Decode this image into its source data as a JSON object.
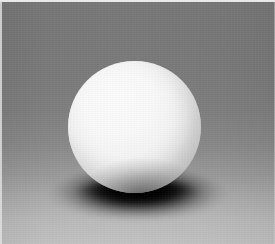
{
  "image": {
    "title": "White sphere on graduated gray background",
    "subject": "matte white sphere",
    "kind": "photograph",
    "width_px": 275,
    "height_px": 244
  },
  "background": {
    "name": "graduated gray studio backdrop",
    "top_color": "#787878",
    "middle_color": "#8a8a8a",
    "bottom_color": "#c2c2c2",
    "gradient_direction": "vertical, dark at top to light at bottom"
  },
  "sphere": {
    "name": "white sphere",
    "fill_color": "#ffffff",
    "terminator_color": "#bdbdbd",
    "highlight_color": "#ffffff",
    "highlight_position": "upper-left",
    "center_x_px": 134,
    "center_y_px": 127,
    "diameter_px": 133
  },
  "shadow": {
    "name": "cast contact shadow",
    "color": "#000000",
    "shape": "ellipse",
    "center_x_px": 138,
    "center_y_px": 196,
    "width_px": 180,
    "height_px": 58
  },
  "border": {
    "name": "scan edge border",
    "color": "#e9e9e9",
    "top_thickness_px": 2,
    "left_thickness_px": 2
  }
}
